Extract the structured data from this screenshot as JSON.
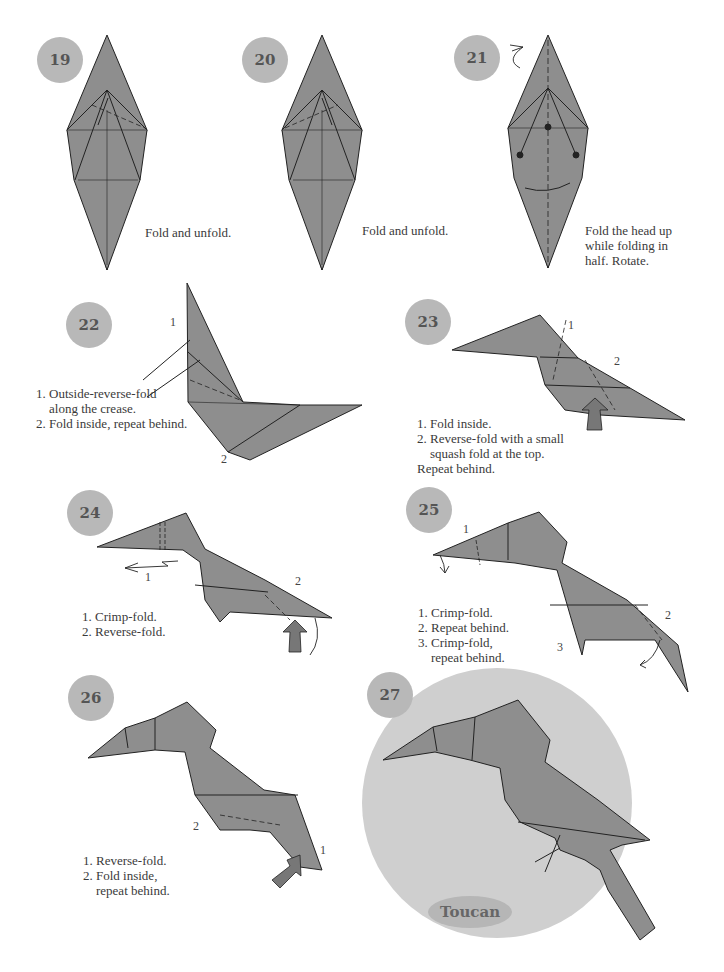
{
  "page": {
    "model_name": "Toucan",
    "colors": {
      "paper": "#8e8e8e",
      "badge": "#b8b8b8",
      "final_circle": "#cfcfcf",
      "title_oval": "#b6b6b6",
      "line": "#222222"
    }
  },
  "steps": [
    {
      "number": "19",
      "caption": "Fold and unfold."
    },
    {
      "number": "20",
      "caption": "Fold and unfold."
    },
    {
      "number": "21",
      "caption": "Fold the head up\nwhile folding in\nhalf. Rotate."
    },
    {
      "number": "22",
      "caption": "1. Outside-reverse-fold\n    along the crease.\n2. Fold inside, repeat behind.",
      "labels": [
        "1",
        "2"
      ]
    },
    {
      "number": "23",
      "caption": "1. Fold inside.\n2. Reverse-fold with a small\n    squash fold at the top.\nRepeat behind.",
      "labels": [
        "1",
        "2"
      ]
    },
    {
      "number": "24",
      "caption": "1. Crimp-fold.\n2. Reverse-fold.",
      "labels": [
        "1",
        "2"
      ]
    },
    {
      "number": "25",
      "caption": "1. Crimp-fold.\n2. Repeat behind.\n3. Crimp-fold,\n    repeat behind.",
      "labels": [
        "1",
        "2",
        "3"
      ]
    },
    {
      "number": "26",
      "caption": "1. Reverse-fold.\n2. Fold inside,\n    repeat behind.",
      "labels": [
        "1",
        "2"
      ]
    },
    {
      "number": "27",
      "caption": "Toucan"
    }
  ]
}
